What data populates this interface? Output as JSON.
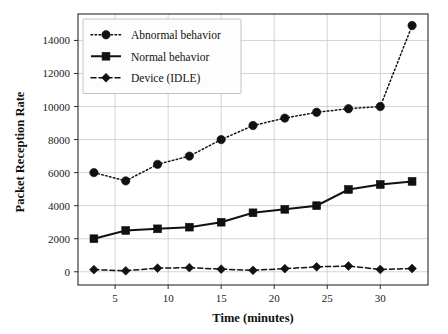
{
  "chart_data": {
    "type": "line",
    "title": "",
    "xlabel": "Time (minutes)",
    "ylabel": "Packet Reception Rate",
    "x": [
      3,
      6,
      9,
      12,
      15,
      18,
      21,
      24,
      27,
      30,
      33
    ],
    "xlim": [
      1.5,
      34.5
    ],
    "ylim": [
      -800,
      15600
    ],
    "xticks": [
      5,
      10,
      15,
      20,
      25,
      30
    ],
    "xtick_labels": [
      "5",
      "10",
      "15",
      "20",
      "25",
      "30"
    ],
    "yticks": [
      0,
      2000,
      4000,
      6000,
      8000,
      10000,
      12000,
      14000
    ],
    "ytick_labels": [
      "0",
      "2000",
      "4000",
      "6000",
      "8000",
      "10000",
      "12000",
      "14000"
    ],
    "grid": true,
    "legend_position": "upper left",
    "series": [
      {
        "name": "Abnormal behavior",
        "values": [
          6000,
          5500,
          6500,
          7000,
          8000,
          8850,
          9300,
          9650,
          9870,
          10000,
          14900
        ],
        "linestyle": "dotted",
        "marker": "circle",
        "color": "#111111"
      },
      {
        "name": "Normal behavior",
        "values": [
          2000,
          2500,
          2600,
          2700,
          3000,
          3570,
          3780,
          4000,
          4980,
          5280,
          5470
        ],
        "linestyle": "solid",
        "marker": "square",
        "color": "#111111"
      },
      {
        "name": "Device (IDLE)",
        "values": [
          130,
          60,
          220,
          250,
          160,
          90,
          190,
          300,
          350,
          140,
          200
        ],
        "linestyle": "dashed",
        "marker": "diamond",
        "color": "#111111"
      }
    ]
  },
  "legend": {
    "entries": [
      {
        "label": "Abnormal behavior"
      },
      {
        "label": "Normal behavior"
      },
      {
        "label": "Device (IDLE)"
      }
    ]
  },
  "colors": {
    "foreground": "#111111",
    "grid": "#c9c9c9",
    "background": "#ffffff",
    "legend_border": "#bdbdbd"
  }
}
